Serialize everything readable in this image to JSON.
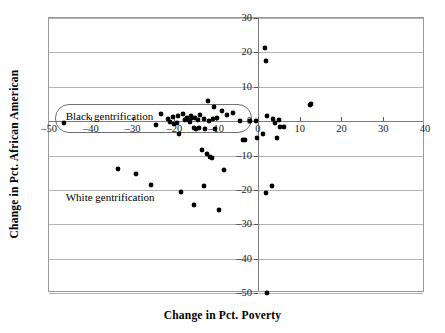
{
  "chart_data": {
    "type": "scatter",
    "title": "",
    "xlabel": "Change in Pct. Poverty",
    "ylabel": "Change in Pct. African American",
    "xlim": [
      -50,
      40
    ],
    "ylim": [
      -50,
      30
    ],
    "xticks": [
      -50,
      -40,
      -30,
      -20,
      -10,
      0,
      10,
      20,
      30,
      40
    ],
    "xticklabels": [
      "–50",
      "–40",
      "–30",
      "–20",
      "–10",
      "0",
      "10",
      "20",
      "30",
      "40"
    ],
    "yticks": [
      30,
      20,
      10,
      0,
      -10,
      -20,
      -30,
      -40,
      -50
    ],
    "yticklabels": [
      "30",
      "20",
      "10",
      "0",
      "–10",
      "–20",
      "–30",
      "–40",
      "–50"
    ],
    "grid": "horizontal",
    "legend": "none",
    "marker": "filled-diamond",
    "marker_color": "#000000",
    "points": [
      [
        -46.5,
        -0.6
      ],
      [
        -33.4,
        -13.8
      ],
      [
        -29.2,
        -15.4
      ],
      [
        -25.5,
        -18.5
      ],
      [
        -24.3,
        -1.0
      ],
      [
        -23.1,
        2.0
      ],
      [
        -21.6,
        0.5
      ],
      [
        -21.0,
        -0.3
      ],
      [
        -20.2,
        1.2
      ],
      [
        -20.0,
        -0.7
      ],
      [
        -19.4,
        -0.4
      ],
      [
        -19.2,
        1.5
      ],
      [
        -19.0,
        -3.8
      ],
      [
        -18.4,
        -20.6
      ],
      [
        -18.0,
        2.2
      ],
      [
        -17.4,
        0.3
      ],
      [
        -17.0,
        0.9
      ],
      [
        -16.6,
        0.4
      ],
      [
        -16.3,
        -0.2
      ],
      [
        -16.0,
        1.6
      ],
      [
        -15.7,
        0.8
      ],
      [
        -15.4,
        -2.0
      ],
      [
        -15.2,
        -24.5
      ],
      [
        -15.0,
        1.0
      ],
      [
        -14.7,
        -2.2
      ],
      [
        -14.4,
        0.2
      ],
      [
        -14.0,
        -2.1
      ],
      [
        -13.8,
        1.8
      ],
      [
        -13.3,
        -8.3
      ],
      [
        -13.0,
        -18.9
      ],
      [
        -12.8,
        0.6
      ],
      [
        -12.6,
        -2.3
      ],
      [
        -12.3,
        -9.7
      ],
      [
        -12.0,
        5.8
      ],
      [
        -11.7,
        0.0
      ],
      [
        -11.4,
        -10.5
      ],
      [
        -11.0,
        -10.8
      ],
      [
        -10.8,
        0.7
      ],
      [
        -10.6,
        4.0
      ],
      [
        -10.2,
        -2.4
      ],
      [
        -9.8,
        1.0
      ],
      [
        -9.4,
        -25.8
      ],
      [
        -8.6,
        3.0
      ],
      [
        -8.0,
        -14.1
      ],
      [
        -7.3,
        1.9
      ],
      [
        -5.9,
        2.3
      ],
      [
        -4.4,
        -0.1
      ],
      [
        -3.6,
        -5.6
      ],
      [
        -3.2,
        -5.6
      ],
      [
        -2.0,
        0.1
      ],
      [
        -0.4,
        0.1
      ],
      [
        -0.2,
        -4.8
      ],
      [
        1.2,
        -3.7
      ],
      [
        1.8,
        21.4
      ],
      [
        1.9,
        17.4
      ],
      [
        2.0,
        -20.8
      ],
      [
        2.1,
        1.5
      ],
      [
        2.3,
        -49.9
      ],
      [
        3.3,
        -19.0
      ],
      [
        3.6,
        0.6
      ],
      [
        4.2,
        -0.4
      ],
      [
        4.6,
        -4.9
      ],
      [
        5.0,
        0.4
      ],
      [
        5.2,
        -1.7
      ],
      [
        6.3,
        -1.8
      ],
      [
        12.4,
        4.6
      ],
      [
        12.8,
        4.9
      ]
    ],
    "annotations": [
      {
        "id": "black-gentrification",
        "text": "Black gentrification",
        "boxed": true,
        "box_xy": [
          -48.5,
          5.1
        ],
        "box_wh": [
          47.0,
          8.6
        ],
        "text_xy": [
          -46.0,
          3.0
        ]
      },
      {
        "id": "white-gentrification",
        "text": "White gentrification",
        "boxed": false,
        "text_xy": [
          -46.0,
          -20.6
        ]
      }
    ]
  }
}
